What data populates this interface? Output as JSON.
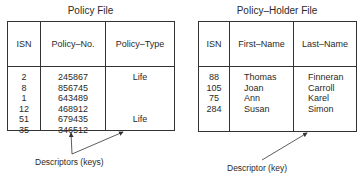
{
  "policy_file": {
    "title": "Policy File",
    "columns": [
      "ISN",
      "Policy–No.",
      "Policy–Type"
    ],
    "rows": [
      {
        "isn": "2",
        "policy_no": "245867",
        "policy_type": "Life"
      },
      {
        "isn": "8",
        "policy_no": "856745",
        "policy_type": ""
      },
      {
        "isn": "1",
        "policy_no": "643489",
        "policy_type": ""
      },
      {
        "isn": "12",
        "policy_no": "468912",
        "policy_type": ""
      },
      {
        "isn": "51",
        "policy_no": "679435",
        "policy_type": "Life"
      },
      {
        "isn": "35",
        "policy_no": "346512",
        "policy_type": ""
      }
    ],
    "annotation": "Descriptors (keys)"
  },
  "policy_holder_file": {
    "title": "Policy–Holder File",
    "columns": [
      "ISN",
      "First–Name",
      "Last–Name"
    ],
    "rows": [
      {
        "isn": "88",
        "first_name": "Thomas",
        "last_name": "Finneran"
      },
      {
        "isn": "105",
        "first_name": "Joan",
        "last_name": "Carroll"
      },
      {
        "isn": "75",
        "first_name": "Ann",
        "last_name": "Karel"
      },
      {
        "isn": "284",
        "first_name": "Susan",
        "last_name": "Simon"
      }
    ],
    "annotation": "Descriptor (key)"
  }
}
